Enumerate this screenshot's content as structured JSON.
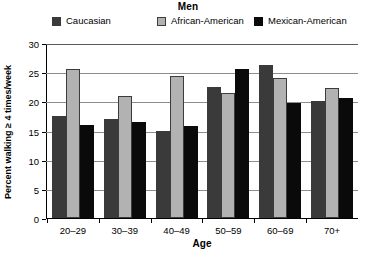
{
  "chart_data": {
    "type": "bar",
    "title": "Men",
    "xlabel": "Age",
    "ylabel": "Percent walking ≥ 4 times/week",
    "categories": [
      "20–29",
      "30–39",
      "40–49",
      "50–59",
      "60–69",
      "70+"
    ],
    "series": [
      {
        "name": "Caucasian",
        "color": "#3a3a3a",
        "values": [
          17.5,
          17.0,
          15.0,
          22.5,
          26.2,
          20.0
        ]
      },
      {
        "name": "African-American",
        "color": "#b2b2b2",
        "values": [
          25.5,
          21.0,
          24.3,
          21.5,
          24.0,
          22.3
        ]
      },
      {
        "name": "Mexican-American",
        "color": "#0a0a0a",
        "values": [
          16.0,
          16.5,
          15.8,
          25.5,
          19.7,
          20.5
        ]
      }
    ],
    "ylim": [
      0,
      30
    ],
    "ytick_labels": [
      "30",
      "25",
      "20",
      "15",
      "10",
      "5",
      "0"
    ],
    "ytick_values": [
      30,
      25,
      20,
      15,
      10,
      5,
      0
    ],
    "grid": true,
    "legend_position": "top"
  }
}
